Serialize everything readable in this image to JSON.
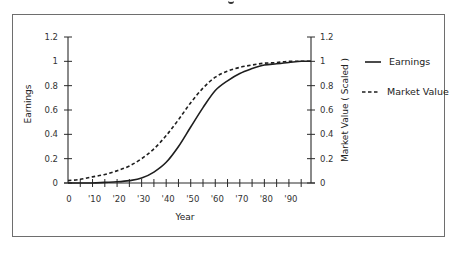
{
  "chart_data": {
    "type": "line",
    "title": "",
    "xlabel": "Year",
    "ylabel": "Earnings",
    "ylabel_right": "Market Value ( Scaled )",
    "x_tick_labels": [
      "0",
      "'10",
      "'20",
      "'30",
      "'40",
      "'50",
      "'60",
      "'70",
      "'80",
      "'90"
    ],
    "x_ticks": [
      0,
      10,
      20,
      30,
      40,
      50,
      60,
      70,
      80,
      90
    ],
    "xlim": [
      0,
      99
    ],
    "y_tick_labels": [
      "0",
      "0.2",
      "0.4",
      "0.6",
      "0.8",
      "1",
      "1.2"
    ],
    "y_ticks": [
      0,
      0.2,
      0.4,
      0.6,
      0.8,
      1.0,
      1.2
    ],
    "ylim": [
      0,
      1.2
    ],
    "y_right_tick_labels": [
      "0",
      "0.2",
      "0.4",
      "0.6",
      "0.8",
      "1",
      "1.2"
    ],
    "ylim_right": [
      0,
      1.2
    ],
    "grid": false,
    "legend_position": "right",
    "x": [
      0,
      5,
      10,
      15,
      20,
      25,
      30,
      35,
      40,
      45,
      50,
      55,
      60,
      65,
      70,
      75,
      80,
      85,
      90,
      95,
      99
    ],
    "series": [
      {
        "name": "Earnings",
        "style": "solid",
        "axis": "left",
        "values": [
          0.0,
          0.0,
          0.0,
          0.005,
          0.01,
          0.02,
          0.04,
          0.09,
          0.17,
          0.3,
          0.46,
          0.62,
          0.76,
          0.84,
          0.9,
          0.94,
          0.97,
          0.98,
          0.99,
          1.0,
          1.0
        ]
      },
      {
        "name": "Market Value",
        "style": "dashed",
        "axis": "right",
        "values": [
          0.02,
          0.03,
          0.05,
          0.07,
          0.1,
          0.14,
          0.2,
          0.28,
          0.39,
          0.52,
          0.66,
          0.78,
          0.87,
          0.92,
          0.95,
          0.97,
          0.985,
          0.99,
          1.0,
          1.0,
          1.0
        ]
      }
    ]
  },
  "legend": {
    "items": [
      {
        "label": "Earnings",
        "style": "solid"
      },
      {
        "label": "Market Value",
        "style": "dashed"
      }
    ]
  },
  "colors": {
    "line": "#1e1e1e",
    "axis": "#2a2a2a",
    "frame": "#6e6e6e"
  }
}
